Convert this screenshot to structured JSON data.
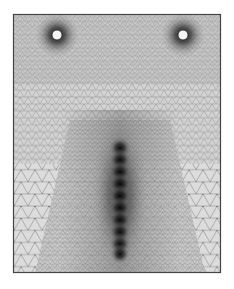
{
  "figure": {
    "type": "finite-element-mesh",
    "caption_top": "· · · · · · · · · · · · · · · · · · · · · · · · · · · ·",
    "caption_bottom": "",
    "frame": {
      "x": 13,
      "y": 14,
      "width": 208,
      "height": 259,
      "stroke": "#444444"
    },
    "background_color": "#d6d6d6",
    "mesh_line_color": "#8a8a8a",
    "holes": [
      {
        "name": "left-hole",
        "cx": 57,
        "cy": 35,
        "r": 5
      },
      {
        "name": "right-hole",
        "cx": 183,
        "cy": 35,
        "r": 5
      }
    ],
    "crack": {
      "x": 120,
      "y_start": 140,
      "y_end": 255,
      "nodes": 10
    }
  }
}
